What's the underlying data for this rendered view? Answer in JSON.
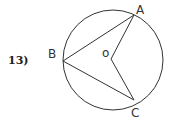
{
  "problem": {
    "number": "13)"
  },
  "diagram": {
    "circle": {
      "cx": 113,
      "cy": 60,
      "r": 50,
      "stroke": "#333333"
    },
    "points": {
      "A": {
        "label": "A",
        "x": 134,
        "y": 15,
        "lx": 136,
        "ly": 14
      },
      "B": {
        "label": "B",
        "x": 63,
        "y": 61,
        "lx": 48,
        "ly": 58
      },
      "C": {
        "label": "C",
        "x": 134,
        "y": 100,
        "lx": 131,
        "ly": 117
      },
      "O": {
        "label": "o",
        "x": 111,
        "y": 59,
        "lx": 102,
        "ly": 57
      }
    },
    "segments": [
      "BA",
      "BC",
      "OA",
      "OC"
    ]
  }
}
